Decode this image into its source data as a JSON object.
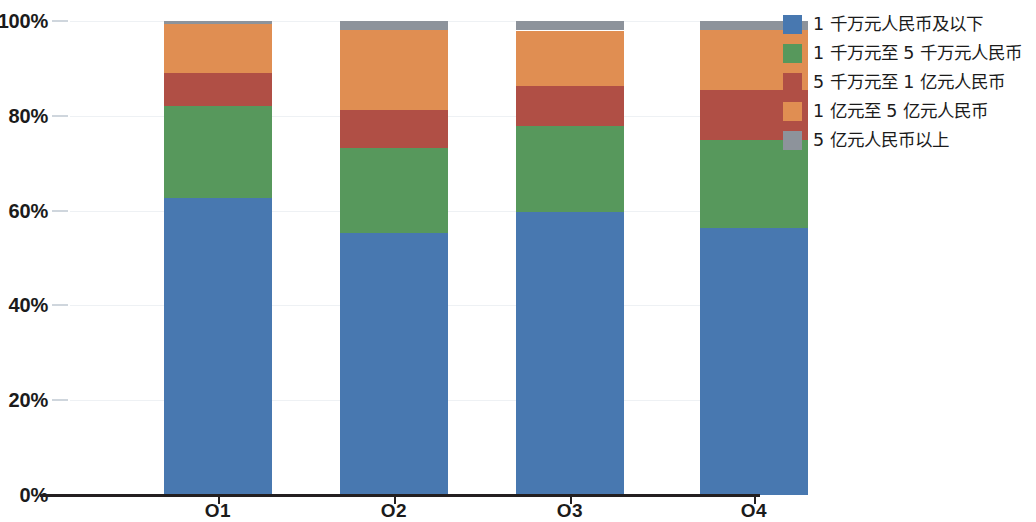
{
  "chart_data": {
    "type": "bar",
    "stacked": true,
    "normalized": true,
    "title": "",
    "subtitle": "",
    "xlabel": "",
    "ylabel": "",
    "categories": [
      "O1",
      "O2",
      "O3",
      "O4"
    ],
    "ylim": [
      0,
      100
    ],
    "ytick_labels": [
      "0%",
      "20%",
      "40%",
      "60%",
      "80%",
      "100%"
    ],
    "ytick_values": [
      0,
      20,
      40,
      60,
      80,
      100
    ],
    "grid": true,
    "legend_position": "right",
    "series": [
      {
        "name": "1 千万元人民币及以下",
        "color": "#4878B0",
        "values": [
          62.7,
          55.3,
          59.7,
          56.3
        ]
      },
      {
        "name": "1 千万元至 5 千万元人民币",
        "color": "#57985C",
        "values": [
          19.4,
          17.9,
          18.1,
          18.6
        ]
      },
      {
        "name": "5 千万元至 1 亿元人民币",
        "color": "#B04F45",
        "values": [
          7.0,
          8.0,
          8.4,
          10.5
        ]
      },
      {
        "name": "1 亿元至 5 亿元人民币",
        "color": "#E08E52",
        "values": [
          10.3,
          16.9,
          11.8,
          12.7
        ]
      },
      {
        "name": "5 亿元人民币以上",
        "color": "#8D939B",
        "values": [
          0.6,
          1.9,
          1.9,
          1.9
        ]
      }
    ]
  }
}
